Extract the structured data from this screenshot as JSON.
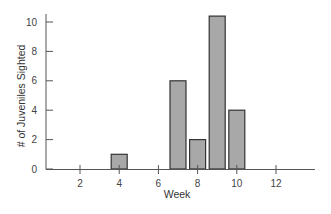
{
  "chart_data": {
    "type": "bar",
    "title": "",
    "xlabel": "Week",
    "ylabel": "# of Juveniles Sighted",
    "x": [
      4,
      7,
      8,
      9,
      10
    ],
    "values": [
      1,
      6,
      2,
      10.4,
      4
    ],
    "xticks": [
      2,
      4,
      6,
      8,
      10,
      12
    ],
    "yticks": [
      0,
      2,
      4,
      6,
      8,
      10
    ],
    "xlim": [
      0,
      14
    ],
    "ylim": [
      0,
      10.5
    ],
    "grid": false,
    "legend": null,
    "colors": {
      "bar_fill": "#a8a8a8",
      "bar_stroke": "#333333",
      "axis": "#555555"
    }
  }
}
